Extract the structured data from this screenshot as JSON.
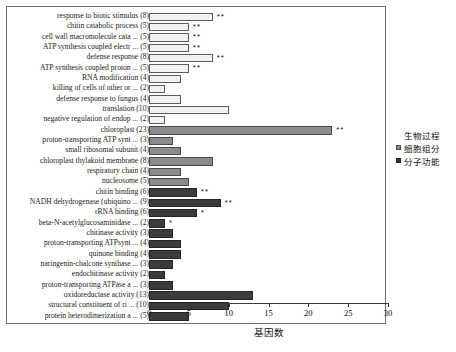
{
  "chart_data": {
    "type": "bar",
    "orientation": "horizontal",
    "title": "",
    "xlabel": "基因数",
    "ylabel": "",
    "xlim": [
      0,
      30
    ],
    "xticks": [
      0,
      5,
      10,
      15,
      20,
      25,
      30
    ],
    "grid": false,
    "legend_position": "right",
    "legend": [
      {
        "name": "生物过程",
        "key": "bp",
        "color": "#f2f2f2"
      },
      {
        "name": "细胞组分",
        "key": "cc",
        "color": "#8c8c8c"
      },
      {
        "name": "分子功能",
        "key": "mf",
        "color": "#3b3b3b"
      }
    ],
    "categories": [
      "response to biotic stimulus (8)",
      "chitin catabolic process (5)",
      "cell wall macromolecule cata ... (5)",
      "ATP synthesis coupled electr ... (5)",
      "defense response (8)",
      "ATP synthesis coupled proton ... (5)",
      "RNA modification (4)",
      "killing of cells of other or ... (2)",
      "defense response to fungus (4)",
      "translation (10)",
      "negative regulation of endop ... (2)",
      "chloroplast (23)",
      "proton-transporting ATP synt ... (3)",
      "small ribosomal subunit (4)",
      "chloroplast thylakoid membrane (8)",
      "respiratory chain (4)",
      "nucleosome (5)",
      "chitin binding (6)",
      "NADH dehydrogenase (ubiquino ... (9)",
      "rRNA binding (6)",
      "beta-N-acetylglucosaminidase ... (2)",
      "chitinase activity (3)",
      "proton-transporting ATPsynt ... (4)",
      "quinone binding (4)",
      "naringenin-chalcone synthase ... (3)",
      "endochitinase activity (2)",
      "proton-transporting ATPase a ... (3)",
      "oxidoreductase activity (13)",
      "structural constituent of ri ... (10)",
      "protein heterodimerization a ... (5)"
    ],
    "values": [
      8,
      5,
      5,
      5,
      8,
      5,
      4,
      2,
      4,
      10,
      2,
      23,
      3,
      4,
      8,
      4,
      5,
      6,
      9,
      6,
      2,
      3,
      4,
      4,
      3,
      2,
      3,
      13,
      10,
      5
    ],
    "groups": [
      "bp",
      "bp",
      "bp",
      "bp",
      "bp",
      "bp",
      "bp",
      "bp",
      "bp",
      "bp",
      "bp",
      "cc",
      "cc",
      "cc",
      "cc",
      "cc",
      "cc",
      "mf",
      "mf",
      "mf",
      "mf",
      "mf",
      "mf",
      "mf",
      "mf",
      "mf",
      "mf",
      "mf",
      "mf",
      "mf"
    ],
    "significance": [
      "**",
      "**",
      "**",
      "**",
      "**",
      "**",
      "",
      "",
      "",
      "",
      "",
      "**",
      "",
      "",
      "",
      "",
      "",
      "**",
      "**",
      "*",
      "*",
      "",
      "",
      "",
      "",
      "",
      "",
      "",
      "",
      ""
    ]
  }
}
